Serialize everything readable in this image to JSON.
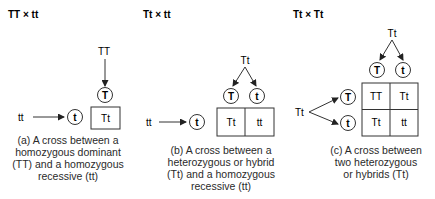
{
  "panels": [
    {
      "title": "TT × tt",
      "top_parent": "TT",
      "left_parent": "tt",
      "top_gametes": [
        "T"
      ],
      "left_gametes": [
        "t"
      ],
      "grid": [
        [
          "Tt"
        ]
      ],
      "caption": [
        "(a) A cross between a",
        "homozygous dominant",
        "(TT) and a homozygous",
        "recessive (tt)"
      ]
    },
    {
      "title": "Tt × tt",
      "top_parent": "Tt",
      "left_parent": "tt",
      "top_gametes": [
        "T",
        "t"
      ],
      "left_gametes": [
        "t"
      ],
      "grid": [
        [
          "Tt",
          "tt"
        ]
      ],
      "caption": [
        "(b) A cross between a",
        "heterozygous or hybrid",
        "(Tt) and a homozygous",
        "recessive (tt)"
      ]
    },
    {
      "title": "Tt × Tt",
      "top_parent": "Tt",
      "left_parent": "Tt",
      "top_gametes": [
        "T",
        "t"
      ],
      "left_gametes": [
        "T",
        "t"
      ],
      "grid": [
        [
          "TT",
          "Tt"
        ],
        [
          "Tt",
          "tt"
        ]
      ],
      "caption": [
        "(c) A cross between",
        "two heterozygous",
        "or hybrids (Tt)"
      ]
    }
  ],
  "colors": {
    "stroke": "#333333",
    "text": "#1a1a1a",
    "background": "#ffffff"
  }
}
